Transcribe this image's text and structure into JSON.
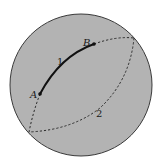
{
  "figure": {
    "colors": {
      "sphere_fill": "#b3b3b3",
      "sphere_outline": "#3a3a3a",
      "solid_arc": "#111111",
      "dashed_arc": "#2a2a2a",
      "background": "#ffffff"
    },
    "sphere": {
      "cx": 81,
      "cy": 85,
      "r": 71
    },
    "points": [
      {
        "id": "A",
        "label": "A",
        "x": 40,
        "y": 94,
        "label_x": 30,
        "label_y": 98
      },
      {
        "id": "B",
        "label": "B",
        "x": 94,
        "y": 44,
        "label_x": 83,
        "label_y": 45
      }
    ],
    "paths": [
      {
        "id": "path-1",
        "label": "1",
        "style": "solid",
        "label_x": 57,
        "label_y": 65
      },
      {
        "id": "path-2",
        "label": "2",
        "style": "dashed",
        "label_x": 96,
        "label_y": 117
      }
    ]
  }
}
